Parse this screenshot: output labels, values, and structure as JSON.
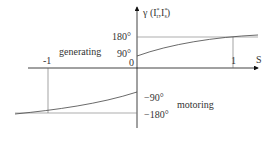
{
  "diagram": {
    "y_axis_label": "γ (I'r, I*s)",
    "y_axis_label_parts": {
      "gamma": "γ (I",
      "r_sup": "*",
      "r_sub": "r",
      "sep": ",I",
      "s_sup": "*",
      "s_sub": "s",
      "close": ")"
    },
    "x_axis_label": "S",
    "regions": {
      "upper": "generating",
      "lower": "motoring"
    },
    "y_ticks": {
      "p180": "180°",
      "p90": "90°",
      "zero": "0",
      "m90": "−90°",
      "m180": "−180°"
    },
    "x_ticks": {
      "minus_one": "-1",
      "plus_one": "1"
    },
    "colors": {
      "axis": "#111111",
      "curve": "#444444",
      "guide": "#555555"
    }
  }
}
